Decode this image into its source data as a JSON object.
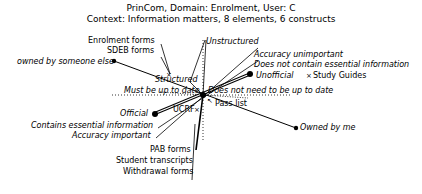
{
  "header": {
    "line1": "PrinCom, Domain: Enrolment, User: C",
    "line2": "Context: Information matters, 8 elements, 6 constructs"
  },
  "diagram": {
    "type": "repertory-grid-principal-components",
    "constructs": [
      {
        "left_pole": "owned by someone else",
        "right_pole": "Owned by me"
      },
      {
        "left_pole": "Official",
        "right_pole": "Unofficial"
      },
      {
        "left_pole": "Contains essential information",
        "right_pole": "Does not contain essential information"
      },
      {
        "left_pole": "Accuracy important",
        "right_pole": "Accuracy unimportant"
      },
      {
        "left_pole": "Structured",
        "right_pole": "Unstructured"
      },
      {
        "left_pole": "Must be up to date",
        "right_pole": "Does not need to be up to date"
      }
    ],
    "elements": [
      "Enrolment forms",
      "SDEB forms",
      "Study Guides",
      "Pass list",
      "UCRF",
      "PAB forms",
      "Student transcripts",
      "Withdrawal forms"
    ],
    "labels": {
      "enrolment_forms": "Enrolment forms",
      "sdeb_forms": "SDEB forms",
      "owned_else": "owned by someone else",
      "structured": "Structured",
      "must_date": "Must be up to date",
      "unstructured": "Unstructured",
      "acc_unimp": "Accuracy unimportant",
      "no_essential": "Does not contain essential information",
      "unofficial": "Unofficial",
      "study_guides": "Study Guides",
      "no_date": "Does not need to be up to date",
      "pass_list": "Pass list",
      "ucrf": "UCRF",
      "official": "Official",
      "essential": "Contains essential information",
      "acc_imp": "Accuracy important",
      "owned_me": "Owned by me",
      "pab_forms": "PAB forms",
      "transcripts": "Student transcripts",
      "withdrawal": "Withdrawal forms"
    }
  }
}
